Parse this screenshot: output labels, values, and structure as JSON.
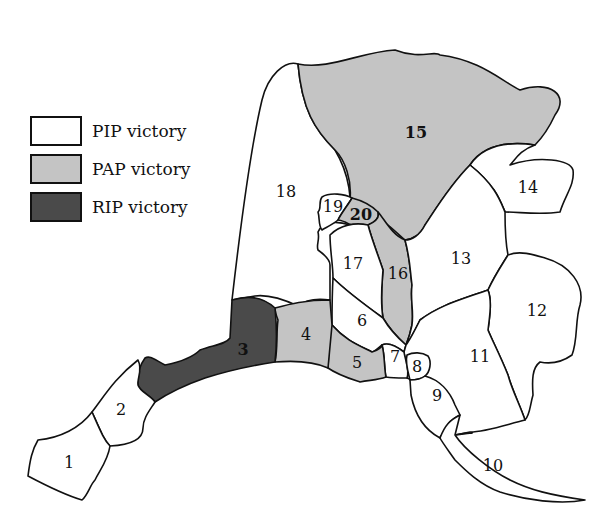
{
  "legend": {
    "items": [
      {
        "label": "PIP victory",
        "party": "PIP",
        "color": "#ffffff"
      },
      {
        "label": "PAP victory",
        "party": "PAP",
        "color": "#c4c4c4"
      },
      {
        "label": "RIP victory",
        "party": "RIP",
        "color": "#4a4a4a"
      }
    ]
  },
  "colors": {
    "PIP": "#ffffff",
    "PAP": "#c4c4c4",
    "RIP": "#4a4a4a",
    "border": "#111111"
  },
  "districts": [
    {
      "id": "1",
      "label": "1",
      "winner": "PIP"
    },
    {
      "id": "2",
      "label": "2",
      "winner": "PIP"
    },
    {
      "id": "3",
      "label": "3",
      "winner": "RIP"
    },
    {
      "id": "4",
      "label": "4",
      "winner": "PAP"
    },
    {
      "id": "5",
      "label": "5",
      "winner": "PAP"
    },
    {
      "id": "6",
      "label": "6",
      "winner": "PIP"
    },
    {
      "id": "7",
      "label": "7",
      "winner": "PIP"
    },
    {
      "id": "8",
      "label": "8",
      "winner": "PIP"
    },
    {
      "id": "9",
      "label": "9",
      "winner": "PIP"
    },
    {
      "id": "10",
      "label": "10",
      "winner": "PIP"
    },
    {
      "id": "11",
      "label": "11",
      "winner": "PIP"
    },
    {
      "id": "12",
      "label": "12",
      "winner": "PIP"
    },
    {
      "id": "13",
      "label": "13",
      "winner": "PIP"
    },
    {
      "id": "14",
      "label": "14",
      "winner": "PIP"
    },
    {
      "id": "15",
      "label": "15",
      "winner": "PAP"
    },
    {
      "id": "16",
      "label": "16",
      "winner": "PAP"
    },
    {
      "id": "17",
      "label": "17",
      "winner": "PIP"
    },
    {
      "id": "18",
      "label": "18",
      "winner": "PIP"
    },
    {
      "id": "19",
      "label": "19",
      "winner": "PIP"
    },
    {
      "id": "20",
      "label": "20",
      "winner": "PAP"
    }
  ]
}
